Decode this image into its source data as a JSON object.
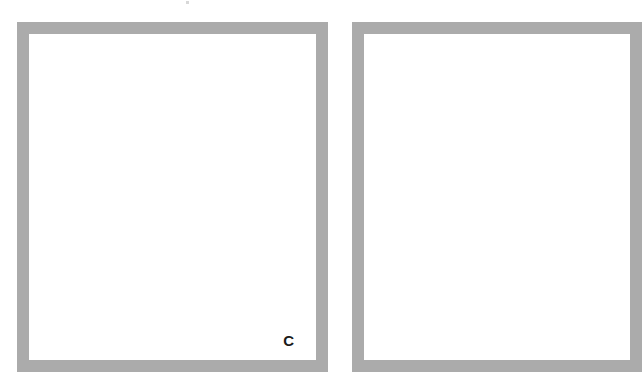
{
  "page": {
    "background": "#ffffff",
    "frame_color": "#ababab"
  },
  "panels": [
    {
      "id": "left",
      "label": "C"
    },
    {
      "id": "right",
      "label": ""
    }
  ]
}
